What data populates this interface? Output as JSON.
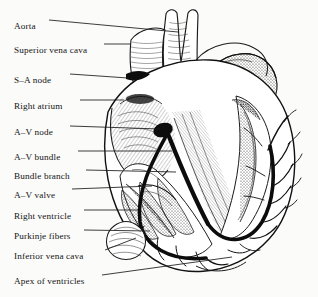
{
  "figure": {
    "background_color": "#fbfbfa",
    "ink_color": "#141414",
    "width": 318,
    "height": 297
  },
  "labels": [
    {
      "id": "aorta",
      "text": "Aorta",
      "x": 14,
      "y": 22,
      "leader": {
        "x1": 49,
        "y1": 20,
        "x2": 178,
        "y2": 32
      }
    },
    {
      "id": "superior-vena-cava",
      "text": "Superior vena cava",
      "x": 14,
      "y": 46,
      "leader": {
        "x1": 104,
        "y1": 44,
        "x2": 131,
        "y2": 44
      }
    },
    {
      "id": "sa-node",
      "text": "S–A node",
      "x": 14,
      "y": 76,
      "leader": {
        "x1": 70,
        "y1": 74,
        "x2": 128,
        "y2": 78
      }
    },
    {
      "id": "right-atrium",
      "text": "Right atrium",
      "x": 14,
      "y": 102,
      "leader": {
        "x1": 80,
        "y1": 100,
        "x2": 124,
        "y2": 100
      }
    },
    {
      "id": "av-node",
      "text": "A–V node",
      "x": 14,
      "y": 128,
      "leader": {
        "x1": 70,
        "y1": 126,
        "x2": 160,
        "y2": 129
      }
    },
    {
      "id": "av-bundle",
      "text": "A–V bundle",
      "x": 14,
      "y": 153,
      "leader": {
        "x1": 78,
        "y1": 151,
        "x2": 172,
        "y2": 151
      }
    },
    {
      "id": "bundle-branch",
      "text": "Bundle branch",
      "x": 14,
      "y": 172,
      "leader": {
        "x1": 86,
        "y1": 170,
        "x2": 176,
        "y2": 172
      }
    },
    {
      "id": "av-valve",
      "text": "A–V valve",
      "x": 14,
      "y": 191,
      "leader": {
        "x1": 72,
        "y1": 189,
        "x2": 152,
        "y2": 186
      }
    },
    {
      "id": "right-ventricle",
      "text": "Right ventricle",
      "x": 14,
      "y": 212,
      "leader": {
        "x1": 84,
        "y1": 210,
        "x2": 138,
        "y2": 210
      }
    },
    {
      "id": "purkinje-fibers",
      "text": "Purkinje fibers",
      "x": 14,
      "y": 232,
      "leader": {
        "x1": 84,
        "y1": 230,
        "x2": 150,
        "y2": 231
      }
    },
    {
      "id": "inferior-vena-cava",
      "text": "Inferior vena cava",
      "x": 14,
      "y": 252,
      "leader": {
        "x1": 105,
        "y1": 250,
        "x2": 136,
        "y2": 238
      }
    },
    {
      "id": "apex-of-ventricles",
      "text": "Apex of ventricles",
      "x": 14,
      "y": 277,
      "leader": {
        "x1": 102,
        "y1": 275,
        "x2": 232,
        "y2": 257
      }
    }
  ],
  "structures": [
    {
      "id": "aorta-vessel",
      "name": "Aorta"
    },
    {
      "id": "superior-vena-cava-vessel",
      "name": "Superior vena cava"
    },
    {
      "id": "pulmonary-artery",
      "name": "Pulmonary artery"
    },
    {
      "id": "left-auricle",
      "name": "Left auricle"
    },
    {
      "id": "right-atrium-chamber",
      "name": "Right atrium"
    },
    {
      "id": "sa-node-marking",
      "name": "S-A node"
    },
    {
      "id": "av-node-marking",
      "name": "A-V node"
    },
    {
      "id": "av-bundle-path",
      "name": "A-V bundle"
    },
    {
      "id": "bundle-branch-left",
      "name": "Left bundle branch"
    },
    {
      "id": "bundle-branch-right",
      "name": "Right bundle branch"
    },
    {
      "id": "purkinje-network",
      "name": "Purkinje fibers"
    },
    {
      "id": "right-ventricle-chamber",
      "name": "Right ventricle"
    },
    {
      "id": "left-ventricle-chamber",
      "name": "Left ventricle"
    },
    {
      "id": "inferior-vena-cava-vessel",
      "name": "Inferior vena cava"
    },
    {
      "id": "ventricular-apex",
      "name": "Apex of ventricles"
    }
  ]
}
